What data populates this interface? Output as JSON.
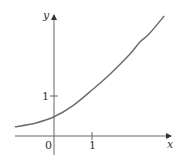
{
  "chart_data": {
    "type": "line",
    "title": "",
    "xlabel": "x",
    "ylabel": "y",
    "x_ticks": [
      {
        "value": 1,
        "label": "1"
      }
    ],
    "y_ticks": [
      {
        "value": 1,
        "label": "1"
      }
    ],
    "origin_label": "0",
    "xlim": [
      -1.03,
      3.1
    ],
    "ylim": [
      -0.6,
      3.3
    ],
    "grid": false,
    "legend": null,
    "series": [
      {
        "name": "curve",
        "color": "#6e6e6e",
        "x": [
          -1.03,
          -0.5,
          0,
          0.5,
          1,
          1.5,
          2,
          2.26,
          2.5,
          2.9
        ],
        "y": [
          0.23,
          0.32,
          0.48,
          0.76,
          1.15,
          1.57,
          2.05,
          2.35,
          2.55,
          3.0
        ]
      }
    ]
  },
  "labels": {
    "x_axis": "x",
    "y_axis": "y",
    "origin": "0",
    "x_tick_1": "1",
    "y_tick_1": "1"
  }
}
